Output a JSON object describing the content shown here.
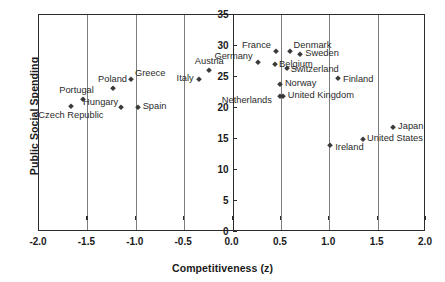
{
  "chart_data": {
    "type": "scatter",
    "title": "",
    "xlabel": "Competitiveness (z)",
    "ylabel": "Public Social Spending",
    "xlim": [
      -2.0,
      2.0
    ],
    "ylim": [
      0,
      35
    ],
    "xticks": [
      "-2.0",
      "-1.5",
      "-1.0",
      "-0.5",
      "0.0",
      "0.5",
      "1.0",
      "1.5",
      "2.0"
    ],
    "xtick_values": [
      -2.0,
      -1.5,
      -1.0,
      -0.5,
      0.0,
      0.5,
      1.0,
      1.5,
      2.0
    ],
    "yticks": [
      "0",
      "5",
      "10",
      "15",
      "20",
      "25",
      "30",
      "35"
    ],
    "ytick_values": [
      0,
      5,
      10,
      15,
      20,
      25,
      30,
      35
    ],
    "grid": "vertical",
    "legend": "none",
    "marker": "diamond",
    "marker_color": "#3a3a3a",
    "points": [
      {
        "label": "Czech Republic",
        "x": -1.67,
        "y": 20.3,
        "pos": "b",
        "dx": 0,
        "dy": 5
      },
      {
        "label": "Portugal",
        "x": -1.55,
        "y": 21.5,
        "pos": "t",
        "dx": -6,
        "dy": -4
      },
      {
        "label": "Hungary",
        "x": -1.15,
        "y": 20.2,
        "pos": "l",
        "dx": -3,
        "dy": -4
      },
      {
        "label": "Poland",
        "x": -1.24,
        "y": 23.2,
        "pos": "t",
        "dx": 0,
        "dy": -4
      },
      {
        "label": "Greece",
        "x": -1.05,
        "y": 24.6,
        "pos": "r",
        "dx": 4,
        "dy": -5
      },
      {
        "label": "Spain",
        "x": -0.98,
        "y": 20.2,
        "pos": "r",
        "dx": 5,
        "dy": 0
      },
      {
        "label": "Italy",
        "x": -0.35,
        "y": 24.6,
        "pos": "l",
        "dx": -5,
        "dy": 0
      },
      {
        "label": "Austria",
        "x": -0.24,
        "y": 26.1,
        "pos": "t",
        "dx": 0,
        "dy": -4
      },
      {
        "label": "Germany",
        "x": 0.26,
        "y": 27.4,
        "pos": "l",
        "dx": -5,
        "dy": -5
      },
      {
        "label": "France",
        "x": 0.45,
        "y": 29.2,
        "pos": "l",
        "dx": -5,
        "dy": -5
      },
      {
        "label": "Belgium",
        "x": 0.44,
        "y": 27.1,
        "pos": "r",
        "dx": 4,
        "dy": 1
      },
      {
        "label": "Denmark",
        "x": 0.59,
        "y": 29.2,
        "pos": "r",
        "dx": 4,
        "dy": -5
      },
      {
        "label": "Switzerland",
        "x": 0.56,
        "y": 26.4,
        "pos": "r",
        "dx": 4,
        "dy": 2
      },
      {
        "label": "Norway",
        "x": 0.49,
        "y": 23.9,
        "pos": "r",
        "dx": 5,
        "dy": 0
      },
      {
        "label": "Netherlands",
        "x": 0.49,
        "y": 21.9,
        "pos": "l",
        "dx": -8,
        "dy": 5
      },
      {
        "label": "United Kingdom",
        "x": 0.52,
        "y": 21.9,
        "pos": "r",
        "dx": 5,
        "dy": 0
      },
      {
        "label": "Sweden",
        "x": 0.7,
        "y": 28.7,
        "pos": "r",
        "dx": 5,
        "dy": 0
      },
      {
        "label": "Finland",
        "x": 1.09,
        "y": 24.8,
        "pos": "r",
        "dx": 5,
        "dy": 2
      },
      {
        "label": "Ireland",
        "x": 1.01,
        "y": 14.0,
        "pos": "r",
        "dx": 5,
        "dy": 3
      },
      {
        "label": "United States",
        "x": 1.35,
        "y": 15.0,
        "pos": "r",
        "dx": 4,
        "dy": 0
      },
      {
        "label": "Japan",
        "x": 1.66,
        "y": 17.0,
        "pos": "r",
        "dx": 5,
        "dy": 0
      }
    ]
  }
}
